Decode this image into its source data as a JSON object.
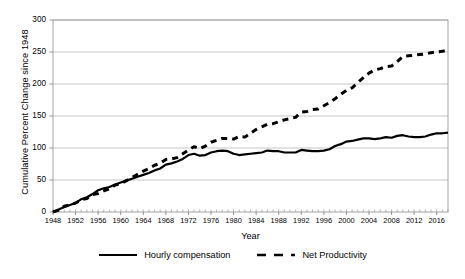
{
  "chart_data": {
    "type": "line",
    "title": "",
    "xlabel": "Year",
    "ylabel": "Cumulative Percent Change since 1948",
    "xlim": [
      1948,
      2018
    ],
    "ylim": [
      0,
      300
    ],
    "grid": true,
    "legend_position": "bottom",
    "ytick_labels": [
      "0",
      "50",
      "100",
      "150",
      "200",
      "250",
      "300"
    ],
    "ytick_values": [
      0,
      50,
      100,
      150,
      200,
      250,
      300
    ],
    "xtick_labels": [
      "1948",
      "1952",
      "1956",
      "1960",
      "1964",
      "1968",
      "1972",
      "1976",
      "1980",
      "1984",
      "1988",
      "1992",
      "1996",
      "2000",
      "2004",
      "2008",
      "2012",
      "2016"
    ],
    "xtick_values": [
      1948,
      1952,
      1956,
      1960,
      1964,
      1968,
      1972,
      1976,
      1980,
      1984,
      1988,
      1992,
      1996,
      2000,
      2004,
      2008,
      2012,
      2016
    ],
    "x": [
      1948,
      1949,
      1950,
      1951,
      1952,
      1953,
      1954,
      1955,
      1956,
      1957,
      1958,
      1959,
      1960,
      1961,
      1962,
      1963,
      1964,
      1965,
      1966,
      1967,
      1968,
      1969,
      1970,
      1971,
      1972,
      1973,
      1974,
      1975,
      1976,
      1977,
      1978,
      1979,
      1980,
      1981,
      1982,
      1983,
      1984,
      1985,
      1986,
      1987,
      1988,
      1989,
      1990,
      1991,
      1992,
      1993,
      1994,
      1995,
      1996,
      1997,
      1998,
      1999,
      2000,
      2001,
      2002,
      2003,
      2004,
      2005,
      2006,
      2007,
      2008,
      2009,
      2010,
      2011,
      2012,
      2013,
      2014,
      2015,
      2016,
      2017,
      2018
    ],
    "series": [
      {
        "name": "Hourly compensation",
        "style": "solid",
        "color": "#000000",
        "values": [
          0,
          4,
          8,
          11,
          14,
          20,
          23,
          28,
          34,
          37,
          39,
          43,
          46,
          49,
          52,
          55,
          58,
          61,
          65,
          68,
          74,
          76,
          79,
          83,
          89,
          91,
          88,
          89,
          93,
          95,
          96,
          95,
          91,
          89,
          90,
          91,
          92,
          93,
          96,
          95,
          95,
          93,
          93,
          93,
          97,
          96,
          95,
          95,
          96,
          98,
          103,
          106,
          110,
          111,
          113,
          115,
          115,
          114,
          115,
          117,
          116,
          119,
          120,
          118,
          117,
          117,
          118,
          121,
          123,
          123,
          124
        ]
      },
      {
        "name": "Net Productivity",
        "style": "dashed",
        "color": "#000000",
        "values": [
          0,
          3,
          9,
          11,
          14,
          19,
          21,
          27,
          29,
          33,
          36,
          42,
          44,
          49,
          54,
          59,
          64,
          68,
          73,
          76,
          82,
          83,
          85,
          91,
          97,
          102,
          99,
          103,
          109,
          112,
          115,
          115,
          114,
          118,
          117,
          123,
          129,
          133,
          137,
          138,
          141,
          144,
          146,
          148,
          156,
          157,
          160,
          161,
          166,
          171,
          177,
          184,
          190,
          194,
          202,
          210,
          217,
          222,
          224,
          227,
          228,
          235,
          243,
          244,
          245,
          246,
          247,
          249,
          250,
          251,
          253
        ]
      }
    ]
  },
  "axes": {
    "y_title": "Cumulative Percent Change since 1948",
    "x_title": "Year"
  },
  "legend": {
    "items": [
      {
        "label": "Hourly compensation",
        "style": "solid"
      },
      {
        "label": "Net Productivity",
        "style": "dashed"
      }
    ]
  }
}
